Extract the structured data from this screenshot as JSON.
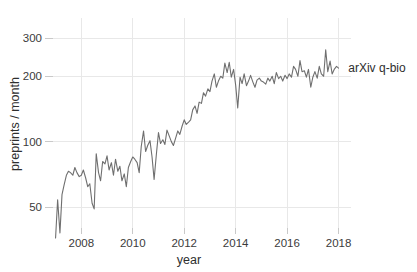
{
  "chart_data": {
    "type": "line",
    "title": "",
    "xlabel": "year",
    "ylabel": "preprints / month",
    "yscale": "log",
    "ylim": [
      33,
      330
    ],
    "xlim": [
      2006.9,
      2018.25
    ],
    "grid": true,
    "legend_position": "right-end-inline",
    "y_ticks": [
      50,
      100,
      200,
      300
    ],
    "y_tick_labels": [
      "50",
      "100",
      "200",
      "300"
    ],
    "x_ticks": [
      2008,
      2010,
      2012,
      2014,
      2016,
      2018
    ],
    "x_tick_labels": [
      "2008",
      "2010",
      "2012",
      "2014",
      "2016",
      "2018"
    ],
    "series": [
      {
        "name": "arXiv q-bio",
        "color": "#6f6f6f",
        "x": [
          2007.0,
          2007.08,
          2007.17,
          2007.25,
          2007.33,
          2007.42,
          2007.5,
          2007.58,
          2007.67,
          2007.75,
          2007.83,
          2007.92,
          2008.0,
          2008.08,
          2008.17,
          2008.25,
          2008.33,
          2008.42,
          2008.5,
          2008.58,
          2008.67,
          2008.75,
          2008.83,
          2008.92,
          2009.0,
          2009.08,
          2009.17,
          2009.25,
          2009.33,
          2009.42,
          2009.5,
          2009.58,
          2009.67,
          2009.75,
          2009.83,
          2009.92,
          2010.0,
          2010.08,
          2010.17,
          2010.25,
          2010.33,
          2010.42,
          2010.5,
          2010.58,
          2010.67,
          2010.75,
          2010.83,
          2010.92,
          2011.0,
          2011.08,
          2011.17,
          2011.25,
          2011.33,
          2011.42,
          2011.5,
          2011.58,
          2011.67,
          2011.75,
          2011.83,
          2011.92,
          2012.0,
          2012.08,
          2012.17,
          2012.25,
          2012.33,
          2012.42,
          2012.5,
          2012.58,
          2012.67,
          2012.75,
          2012.83,
          2012.92,
          2013.0,
          2013.08,
          2013.17,
          2013.25,
          2013.33,
          2013.42,
          2013.5,
          2013.58,
          2013.67,
          2013.75,
          2013.83,
          2013.92,
          2014.0,
          2014.08,
          2014.17,
          2014.25,
          2014.33,
          2014.42,
          2014.5,
          2014.58,
          2014.67,
          2014.75,
          2014.83,
          2014.92,
          2015.0,
          2015.08,
          2015.17,
          2015.25,
          2015.33,
          2015.42,
          2015.5,
          2015.58,
          2015.67,
          2015.75,
          2015.83,
          2015.92,
          2016.0,
          2016.08,
          2016.17,
          2016.25,
          2016.33,
          2016.42,
          2016.5,
          2016.58,
          2016.67,
          2016.75,
          2016.83,
          2016.92,
          2017.0,
          2017.08,
          2017.17,
          2017.25,
          2017.33,
          2017.42,
          2017.5,
          2017.58,
          2017.67,
          2017.75,
          2017.83,
          2017.92,
          2018.0
        ],
        "values": [
          36,
          54,
          38,
          57,
          63,
          70,
          73,
          72,
          70,
          76,
          72,
          69,
          70,
          74,
          68,
          62,
          64,
          52,
          49,
          88,
          72,
          66,
          81,
          79,
          86,
          74,
          80,
          70,
          83,
          73,
          77,
          66,
          71,
          62,
          76,
          81,
          85,
          83,
          80,
          72,
          95,
          112,
          90,
          96,
          101,
          85,
          67,
          88,
          110,
          98,
          102,
          97,
          113,
          106,
          100,
          96,
          104,
          112,
          108,
          118,
          126,
          120,
          123,
          126,
          140,
          146,
          135,
          152,
          150,
          168,
          162,
          175,
          170,
          190,
          205,
          178,
          190,
          200,
          196,
          230,
          208,
          232,
          198,
          215,
          182,
          143,
          198,
          185,
          205,
          181,
          190,
          202,
          188,
          178,
          192,
          196,
          190,
          188,
          184,
          196,
          190,
          200,
          185,
          208,
          195,
          200,
          190,
          202,
          195,
          205,
          198,
          222,
          215,
          200,
          236,
          210,
          212,
          198,
          215,
          178,
          198,
          210,
          196,
          222,
          205,
          200,
          265,
          210,
          235,
          205,
          215,
          222,
          218
        ]
      }
    ],
    "annotations": [
      {
        "text": "arXiv q-bio",
        "x": 2018.3,
        "y": 218,
        "name": "series-end-label"
      }
    ]
  }
}
